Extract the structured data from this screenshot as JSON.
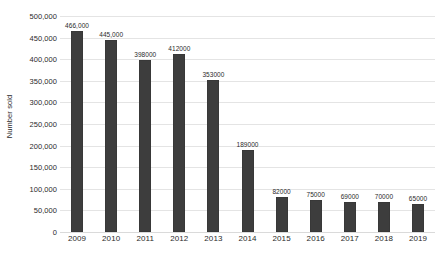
{
  "chart_data": {
    "type": "bar",
    "title": "",
    "subtitle": "",
    "xlabel": "",
    "ylabel": "Number sold",
    "categories": [
      "2009",
      "2010",
      "2011",
      "2012",
      "2013",
      "2014",
      "2015",
      "2016",
      "2017",
      "2018",
      "2019"
    ],
    "values": [
      466000,
      445000,
      398000,
      412000,
      353000,
      189000,
      82000,
      75000,
      69000,
      70000,
      65000
    ],
    "data_labels": [
      "466,000",
      "445,000",
      "398000",
      "412000",
      "353000",
      "189000",
      "82000",
      "75000",
      "69000",
      "70000",
      "65000"
    ],
    "ylim": [
      0,
      500000
    ],
    "ytick_values": [
      0,
      50000,
      100000,
      150000,
      200000,
      250000,
      300000,
      350000,
      400000,
      450000,
      500000
    ],
    "ytick_labels": [
      "0",
      "50,000",
      "100,000",
      "150,000",
      "200,000",
      "250,000",
      "300,000",
      "350,000",
      "400,000",
      "450,000",
      "500,000"
    ],
    "grid": true,
    "grid_axis": "y",
    "legend": false,
    "legend_position": "none",
    "bar_color": "#3d3d3d",
    "gridline_color": "#e4e4e4",
    "background_color": "#ffffff",
    "text_color": "#2b2b2b"
  }
}
